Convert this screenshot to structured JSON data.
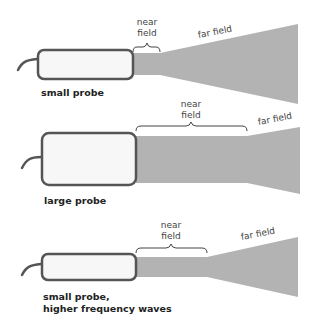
{
  "colors": {
    "beam": "#b3b3b3",
    "probe_fill": "#f7f7f7",
    "probe_stroke": "#555555",
    "text": "#444444"
  },
  "panels": [
    {
      "name": "small probe",
      "probe_label": "small probe",
      "near_label_line1": "near",
      "near_label_line2": "field",
      "far_label": "far field"
    },
    {
      "name": "large probe",
      "probe_label": "large probe",
      "near_label_line1": "near",
      "near_label_line2": "field",
      "far_label": "far field"
    },
    {
      "name": "small probe, higher frequency waves",
      "probe_label_line1": "small probe,",
      "probe_label_line2": "higher frequency waves",
      "near_label_line1": "near",
      "near_label_line2": "field",
      "far_label": "far field"
    }
  ]
}
